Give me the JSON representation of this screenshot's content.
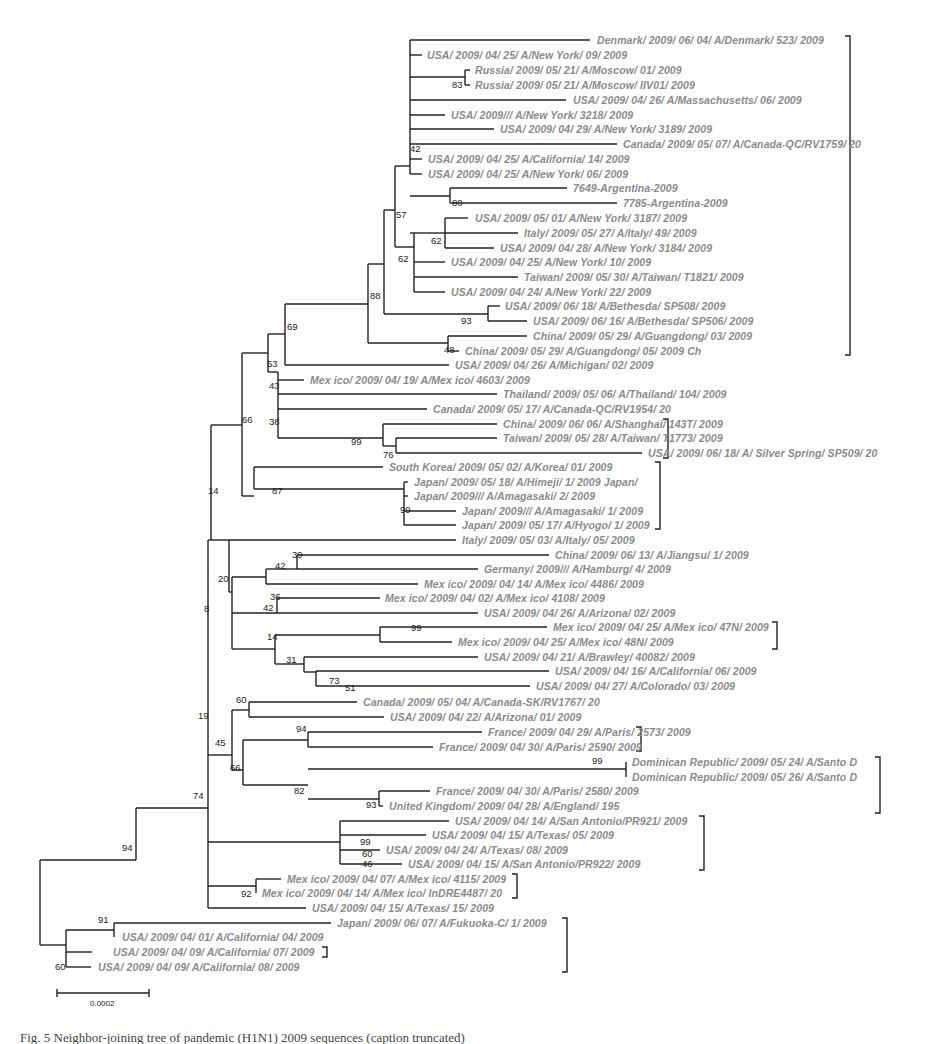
{
  "figure": {
    "type": "phylogenetic-tree",
    "scale_bar": {
      "label": "0.0002",
      "x1": 57,
      "x2": 149,
      "y": 993
    },
    "caption_partial": "Fig. 5 Neighbor-joining tree of pandemic (H1N1) 2009 sequences (caption truncated)",
    "highlight_marker": {
      "shape": "diamond",
      "color": "#555555",
      "leaf_index": 66
    }
  },
  "leaves": [
    {
      "label": "Denmark/ 2009/ 06/ 04/  A/Denmark/ 523/ 2009",
      "x": 594,
      "y": 40
    },
    {
      "label": "USA/ 2009/ 04/ 25/  A/New York/ 09/ 2009",
      "x": 424,
      "y": 55
    },
    {
      "label": "Russia/ 2009/ 05/ 21/  A/Moscow/ 01/ 2009",
      "x": 472,
      "y": 70
    },
    {
      "label": "Russia/ 2009/ 05/ 21/  A/Moscow/ IIV01/ 2009",
      "x": 472,
      "y": 85
    },
    {
      "label": "USA/ 2009/ 04/ 26/  A/Massachusetts/ 06/ 2009",
      "x": 570,
      "y": 100
    },
    {
      "label": "USA/ 2009/// A/New York/ 3218/ 2009",
      "x": 448,
      "y": 115
    },
    {
      "label": "USA/ 2009/ 04/ 29/  A/New York/ 3189/ 2009",
      "x": 497,
      "y": 129
    },
    {
      "label": "Canada/ 2009/ 05/ 07/  A/Canada-QC/RV1759/ 20",
      "x": 620,
      "y": 144
    },
    {
      "label": "USA/ 2009/ 04/ 25/  A/California/ 14/ 2009",
      "x": 425,
      "y": 159
    },
    {
      "label": "USA/ 2009/ 04/ 25/  A/New York/ 06/ 2009",
      "x": 425,
      "y": 174
    },
    {
      "label": "7649-Argentina-2009",
      "x": 570,
      "y": 188
    },
    {
      "label": "7785-Argentina-2009",
      "x": 620,
      "y": 203
    },
    {
      "label": "USA/ 2009/ 05/ 01/  A/New York/ 3187/ 2009",
      "x": 472,
      "y": 218
    },
    {
      "label": "Italy/ 2009/ 05/ 27/  A/Italy/ 49/ 2009",
      "x": 521,
      "y": 233
    },
    {
      "label": "USA/ 2009/ 04/ 28/  A/New York/ 3184/ 2009",
      "x": 497,
      "y": 248
    },
    {
      "label": "USA/ 2009/ 04/ 25/  A/New York/ 10/ 2009",
      "x": 448,
      "y": 262
    },
    {
      "label": "Taiwan/ 2009/ 05/ 30/  A/Taiwan/ T1821/ 2009",
      "x": 521,
      "y": 277
    },
    {
      "label": "USA/ 2009/ 04/ 24/  A/New York/ 22/ 2009",
      "x": 448,
      "y": 292
    },
    {
      "label": "USA/ 2009/ 06/ 18/  A/Bethesda/ SP508/ 2009",
      "x": 502,
      "y": 306
    },
    {
      "label": "USA/ 2009/ 06/ 16/  A/Bethesda/ SP506/ 2009",
      "x": 530,
      "y": 321
    },
    {
      "label": "China/ 2009/ 05/ 29/  A/Guangdong/ 03/ 2009",
      "x": 530,
      "y": 336
    },
    {
      "label": "China/ 2009/ 05/ 29/  A/Guangdong/ 05/ 2009 Ch",
      "x": 462,
      "y": 351
    },
    {
      "label": "USA/ 2009/ 04/ 26/  A/Michigan/ 02/ 2009",
      "x": 452,
      "y": 365
    },
    {
      "label": "Mex ico/ 2009/ 04/ 19/  A/Mex ico/ 4603/ 2009",
      "x": 307,
      "y": 380
    },
    {
      "label": "Thailand/ 2009/ 05/ 06/  A/Thailand/ 104/ 2009",
      "x": 500,
      "y": 394
    },
    {
      "label": "Canada/ 2009/ 05/ 17/  A/Canada-QC/RV1954/ 20",
      "x": 430,
      "y": 409
    },
    {
      "label": "China/ 2009/ 06/ 06/  A/Shanghai/ 143T/ 2009",
      "x": 500,
      "y": 424
    },
    {
      "label": "Taiwan/ 2009/ 05/ 28/  A/Taiwan/ T1773/ 2009",
      "x": 500,
      "y": 438
    },
    {
      "label": "USA/ 2009/ 06/ 18/  A/ Silver Spring/ SP509/ 20",
      "x": 645,
      "y": 453
    },
    {
      "label": "South Korea/ 2009/ 05/ 02/  A/Korea/ 01/ 2009",
      "x": 386,
      "y": 467
    },
    {
      "label": "Japan/ 2009/ 05/ 18/  A/Himeji/ 1/ 2009 Japan/",
      "x": 411,
      "y": 482
    },
    {
      "label": "Japan/ 2009///  A/Amagasaki/ 2/ 2009",
      "x": 411,
      "y": 496
    },
    {
      "label": "Japan/ 2009///  A/Amagasaki/ 1/ 2009",
      "x": 459,
      "y": 511
    },
    {
      "label": "Japan/ 2009/ 05/ 17/  A/Hyogo/ 1/ 2009",
      "x": 459,
      "y": 525
    },
    {
      "label": "Italy/ 2009/ 05/ 03/  A/Italy/ 05/ 2009",
      "x": 459,
      "y": 540
    },
    {
      "label": "China/ 2009/ 06/ 13/  A/Jiangsu/ 1/ 2009",
      "x": 552,
      "y": 555
    },
    {
      "label": "Germany/ 2009///  A/Hamburg/ 4/ 2009",
      "x": 481,
      "y": 569
    },
    {
      "label": "Mex ico/ 2009/ 04/ 14/  A/Mex ico/ 4486/ 2009",
      "x": 421,
      "y": 584
    },
    {
      "label": "Mex ico/ 2009/ 04/ 02/  A/Mex ico/ 4108/ 2009",
      "x": 382,
      "y": 598
    },
    {
      "label": "USA/ 2009/ 04/ 26/  A/Arizona/ 02/ 2009",
      "x": 481,
      "y": 613
    },
    {
      "label": "Mex ico/ 2009/ 04/ 25/  A/Mex ico/ 47N/ 2009",
      "x": 550,
      "y": 627
    },
    {
      "label": "Mex ico/ 2009/ 04/ 25/  A/Mex ico/ 48N/ 2009",
      "x": 455,
      "y": 642
    },
    {
      "label": "USA/ 2009/ 04/ 21/  A/Brawley/ 40082/ 2009",
      "x": 481,
      "y": 657
    },
    {
      "label": "USA/ 2009/ 04/ 16/  A/California/ 06/ 2009",
      "x": 552,
      "y": 671
    },
    {
      "label": "USA/ 2009/ 04/ 27/  A/Colorado/ 03/ 2009",
      "x": 533,
      "y": 686
    },
    {
      "label": "Canada/ 2009/ 05/ 04/  A/Canada-SK/RV1767/ 20",
      "x": 360,
      "y": 702
    },
    {
      "label": "USA/ 2009/ 04/ 22/  A/Arizona/ 01/ 2009",
      "x": 387,
      "y": 717
    },
    {
      "label": "France/ 2009/ 04/ 29/  A/Paris/ 2573/ 2009",
      "x": 485,
      "y": 732
    },
    {
      "label": "France/ 2009/ 04/ 30/  A/Paris/ 2590/ 2009",
      "x": 436,
      "y": 747
    },
    {
      "label": "Dominican Republic/ 2009/ 05/ 24/  A/Santo D",
      "x": 629,
      "y": 762
    },
    {
      "label": "Dominican Republic/ 2009/ 05/ 26/  A/Santo D",
      "x": 629,
      "y": 777
    },
    {
      "label": "France/ 2009/ 04/ 30/  A/Paris/ 2580/ 2009",
      "x": 433,
      "y": 791
    },
    {
      "label": "United Kingdom/ 2009/ 04/ 28/  A/England/ 195",
      "x": 386,
      "y": 806
    },
    {
      "label": "USA/ 2009/ 04/ 14/  A/San Antonio/PR921/ 2009",
      "x": 452,
      "y": 821
    },
    {
      "label": "USA/ 2009/ 04/ 15/  A/Texas/ 05/ 2009",
      "x": 429,
      "y": 835
    },
    {
      "label": "USA/ 2009/ 04/ 24/  A/Texas/ 08/ 2009",
      "x": 383,
      "y": 850
    },
    {
      "label": "USA/ 2009/ 04/ 15/  A/San Antonio/PR922/ 2009",
      "x": 405,
      "y": 864
    },
    {
      "label": "Mex ico/ 2009/ 04/ 07/  A/Mex ico/ 4115/ 2009",
      "x": 284,
      "y": 879
    },
    {
      "label": "Mex ico/ 2009/ 04/ 14/  A/Mex ico/ InDRE4487/ 20",
      "x": 259,
      "y": 893
    },
    {
      "label": "USA/ 2009/ 04/ 15/  A/Texas/ 15/ 2009",
      "x": 309,
      "y": 908
    },
    {
      "label": "Japan/ 2009/ 06/ 07/  A/Fukuoka-C/ 1/ 2009",
      "x": 334,
      "y": 923
    },
    {
      "label": "USA/ 2009/ 04/ 01/  A/California/ 04/ 2009",
      "x": 119,
      "y": 937
    },
    {
      "label": "USA/ 2009/ 04/ 09/  A/California/ 07/ 2009",
      "x": 110,
      "y": 952
    },
    {
      "label": "USA/ 2009/ 04/ 09/  A/California/ 08/ 2009",
      "x": 95,
      "y": 967
    }
  ],
  "bootstrap": [
    {
      "value": "83",
      "x": 452,
      "y": 88
    },
    {
      "value": "42",
      "x": 410,
      "y": 152
    },
    {
      "value": "80",
      "x": 452,
      "y": 206
    },
    {
      "value": "57",
      "x": 396,
      "y": 218
    },
    {
      "value": "62",
      "x": 431,
      "y": 244
    },
    {
      "value": "62",
      "x": 398,
      "y": 262
    },
    {
      "value": "93",
      "x": 461,
      "y": 324
    },
    {
      "value": "88",
      "x": 370,
      "y": 299
    },
    {
      "value": "48",
      "x": 444,
      "y": 353
    },
    {
      "value": "69",
      "x": 287,
      "y": 330
    },
    {
      "value": "53",
      "x": 267,
      "y": 367
    },
    {
      "value": "43",
      "x": 269,
      "y": 389
    },
    {
      "value": "66",
      "x": 242,
      "y": 423
    },
    {
      "value": "38",
      "x": 269,
      "y": 425
    },
    {
      "value": "99",
      "x": 351,
      "y": 445
    },
    {
      "value": "76",
      "x": 383,
      "y": 458
    },
    {
      "value": "87",
      "x": 272,
      "y": 494
    },
    {
      "value": "99",
      "x": 400,
      "y": 513
    },
    {
      "value": "14",
      "x": 208,
      "y": 494
    },
    {
      "value": "39",
      "x": 292,
      "y": 558
    },
    {
      "value": "42",
      "x": 275,
      "y": 569
    },
    {
      "value": "20",
      "x": 218,
      "y": 582
    },
    {
      "value": "36",
      "x": 270,
      "y": 600
    },
    {
      "value": "42",
      "x": 263,
      "y": 611
    },
    {
      "value": "8",
      "x": 204,
      "y": 612
    },
    {
      "value": "99",
      "x": 411,
      "y": 631
    },
    {
      "value": "14",
      "x": 267,
      "y": 640
    },
    {
      "value": "31",
      "x": 286,
      "y": 663
    },
    {
      "value": "73",
      "x": 329,
      "y": 684
    },
    {
      "value": "51",
      "x": 345,
      "y": 691
    },
    {
      "value": "60",
      "x": 236,
      "y": 703
    },
    {
      "value": "19",
      "x": 198,
      "y": 719
    },
    {
      "value": "94",
      "x": 296,
      "y": 732
    },
    {
      "value": "45",
      "x": 215,
      "y": 746
    },
    {
      "value": "66",
      "x": 230,
      "y": 771
    },
    {
      "value": "99",
      "x": 592,
      "y": 764
    },
    {
      "value": "82",
      "x": 294,
      "y": 794
    },
    {
      "value": "93",
      "x": 366,
      "y": 808
    },
    {
      "value": "74",
      "x": 193,
      "y": 799
    },
    {
      "value": "99",
      "x": 360,
      "y": 845
    },
    {
      "value": "60",
      "x": 362,
      "y": 857
    },
    {
      "value": "46",
      "x": 362,
      "y": 867
    },
    {
      "value": "92",
      "x": 241,
      "y": 897
    },
    {
      "value": "94",
      "x": 122,
      "y": 851
    },
    {
      "value": "91",
      "x": 98,
      "y": 923
    },
    {
      "value": "60",
      "x": 55,
      "y": 970
    }
  ],
  "clade_brackets": [
    {
      "x": 850,
      "y1": 36,
      "y2": 355
    },
    {
      "x": 668,
      "y1": 419,
      "y2": 458
    },
    {
      "x": 660,
      "y1": 462,
      "y2": 529
    },
    {
      "x": 777,
      "y1": 622,
      "y2": 649
    },
    {
      "x": 641,
      "y1": 727,
      "y2": 751
    },
    {
      "x": 880,
      "y1": 757,
      "y2": 813
    },
    {
      "x": 704,
      "y1": 816,
      "y2": 870
    },
    {
      "x": 517,
      "y1": 874,
      "y2": 898
    },
    {
      "x": 567,
      "y1": 918,
      "y2": 972
    },
    {
      "x": 327,
      "y1": 947,
      "y2": 957
    }
  ],
  "branches_h": [
    [
      410,
      590,
      40
    ],
    [
      410,
      422,
      55
    ],
    [
      410,
      465,
      77
    ],
    [
      465,
      470,
      70
    ],
    [
      465,
      470,
      85
    ],
    [
      410,
      566,
      100
    ],
    [
      410,
      445,
      115
    ],
    [
      410,
      494,
      129
    ],
    [
      410,
      617,
      144
    ],
    [
      410,
      422,
      159
    ],
    [
      410,
      422,
      174
    ],
    [
      410,
      450,
      196
    ],
    [
      450,
      567,
      188
    ],
    [
      450,
      617,
      203
    ],
    [
      414,
      445,
      233
    ],
    [
      445,
      468,
      218
    ],
    [
      445,
      518,
      233
    ],
    [
      445,
      494,
      248
    ],
    [
      414,
      410,
      233
    ],
    [
      414,
      445,
      262
    ],
    [
      414,
      518,
      277
    ],
    [
      414,
      445,
      292
    ],
    [
      395,
      410,
      166
    ],
    [
      395,
      414,
      247
    ],
    [
      384,
      395,
      210
    ],
    [
      384,
      488,
      314
    ],
    [
      488,
      500,
      306
    ],
    [
      488,
      527,
      321
    ],
    [
      368,
      384,
      264
    ],
    [
      368,
      448,
      343
    ],
    [
      448,
      527,
      336
    ],
    [
      448,
      459,
      351
    ],
    [
      285,
      368,
      304
    ],
    [
      285,
      449,
      365
    ],
    [
      268,
      285,
      334
    ],
    [
      268,
      278,
      372
    ],
    [
      278,
      304,
      380
    ],
    [
      278,
      497,
      394
    ],
    [
      278,
      427,
      409
    ],
    [
      278,
      383,
      438
    ],
    [
      383,
      497,
      424
    ],
    [
      383,
      396,
      446
    ],
    [
      396,
      497,
      438
    ],
    [
      396,
      642,
      453
    ],
    [
      242,
      268,
      353
    ],
    [
      242,
      254,
      496
    ],
    [
      254,
      383,
      467
    ],
    [
      254,
      404,
      489
    ],
    [
      404,
      408,
      482
    ],
    [
      404,
      408,
      496
    ],
    [
      404,
      456,
      511
    ],
    [
      404,
      456,
      525
    ],
    [
      211,
      242,
      425
    ],
    [
      211,
      229,
      540
    ],
    [
      229,
      456,
      540
    ],
    [
      229,
      232,
      592
    ],
    [
      232,
      266,
      577
    ],
    [
      266,
      297,
      569
    ],
    [
      297,
      549,
      555
    ],
    [
      297,
      478,
      569
    ],
    [
      266,
      418,
      584
    ],
    [
      232,
      277,
      613
    ],
    [
      277,
      380,
      598
    ],
    [
      277,
      478,
      613
    ],
    [
      232,
      244,
      649
    ],
    [
      244,
      275,
      649
    ],
    [
      275,
      380,
      635
    ],
    [
      380,
      547,
      627
    ],
    [
      380,
      452,
      642
    ],
    [
      275,
      304,
      664
    ],
    [
      304,
      478,
      657
    ],
    [
      304,
      316,
      672
    ],
    [
      316,
      549,
      671
    ],
    [
      316,
      530,
      686
    ],
    [
      208,
      211,
      540
    ],
    [
      208,
      232,
      755
    ],
    [
      232,
      249,
      710
    ],
    [
      249,
      357,
      702
    ],
    [
      249,
      384,
      717
    ],
    [
      232,
      243,
      770
    ],
    [
      243,
      308,
      740
    ],
    [
      308,
      482,
      732
    ],
    [
      308,
      433,
      747
    ],
    [
      243,
      308,
      785
    ],
    [
      308,
      626,
      769
    ],
    [
      626,
      626,
      762
    ],
    [
      626,
      626,
      777
    ],
    [
      308,
      379,
      799
    ],
    [
      379,
      430,
      791
    ],
    [
      379,
      383,
      806
    ],
    [
      208,
      340,
      842
    ],
    [
      340,
      449,
      821
    ],
    [
      340,
      426,
      835
    ],
    [
      340,
      380,
      850
    ],
    [
      340,
      402,
      864
    ],
    [
      208,
      256,
      886
    ],
    [
      256,
      281,
      879
    ],
    [
      256,
      256,
      893
    ],
    [
      208,
      306,
      908
    ],
    [
      136,
      208,
      808
    ],
    [
      40,
      136,
      860
    ],
    [
      40,
      66,
      945
    ],
    [
      66,
      114,
      930
    ],
    [
      114,
      331,
      923
    ],
    [
      66,
      92,
      952
    ],
    [
      66,
      91,
      967
    ]
  ],
  "branches_v": [
    [
      410,
      40,
      174
    ],
    [
      465,
      70,
      85
    ],
    [
      450,
      188,
      203
    ],
    [
      445,
      218,
      248
    ],
    [
      414,
      233,
      292
    ],
    [
      395,
      166,
      247
    ],
    [
      384,
      210,
      314
    ],
    [
      488,
      306,
      321
    ],
    [
      368,
      264,
      343
    ],
    [
      448,
      336,
      351
    ],
    [
      285,
      304,
      365
    ],
    [
      278,
      372,
      438
    ],
    [
      383,
      424,
      446
    ],
    [
      396,
      438,
      453
    ],
    [
      268,
      334,
      372
    ],
    [
      254,
      467,
      489
    ],
    [
      404,
      482,
      525
    ],
    [
      242,
      353,
      496
    ],
    [
      229,
      540,
      592
    ],
    [
      232,
      577,
      649
    ],
    [
      266,
      569,
      584
    ],
    [
      297,
      555,
      569
    ],
    [
      277,
      598,
      613
    ],
    [
      275,
      635,
      664
    ],
    [
      380,
      627,
      642
    ],
    [
      304,
      657,
      672
    ],
    [
      316,
      671,
      686
    ],
    [
      211,
      425,
      540
    ],
    [
      249,
      702,
      717
    ],
    [
      243,
      740,
      785
    ],
    [
      308,
      732,
      747
    ],
    [
      626,
      762,
      777
    ],
    [
      379,
      791,
      806
    ],
    [
      232,
      710,
      770
    ],
    [
      340,
      821,
      864
    ],
    [
      256,
      879,
      893
    ],
    [
      208,
      540,
      908
    ],
    [
      136,
      808,
      860
    ],
    [
      40,
      860,
      945
    ],
    [
      66,
      930,
      967
    ],
    [
      114,
      923,
      937
    ]
  ]
}
